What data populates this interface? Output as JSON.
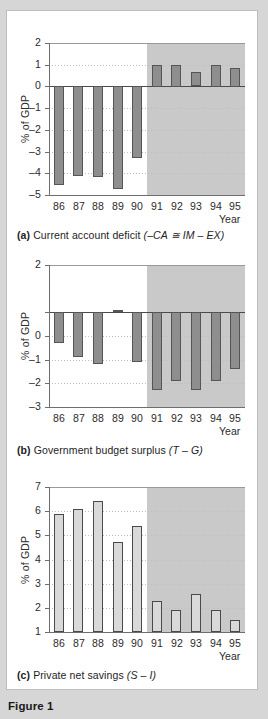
{
  "figure": {
    "label": "Figure 1",
    "panels": [
      {
        "id": "a",
        "tag": "(a)",
        "caption_text": "Current account deficit (–CA ≅ IM – EX)",
        "caption_plain": "Current account deficit",
        "caption_formula": "(–CA ≅ IM – EX)",
        "ylabel": "% of GDP",
        "xlabel": "Year",
        "yticks": [
          "2",
          "1",
          "0",
          "–1",
          "–2",
          "–3",
          "–4",
          "–5"
        ],
        "xticks": [
          "86",
          "87",
          "88",
          "89",
          "90",
          "91",
          "92",
          "93",
          "94",
          "95"
        ]
      },
      {
        "id": "b",
        "tag": "(b)",
        "caption_text": "Government budget surplus (T – G)",
        "caption_plain": "Government budget surplus",
        "caption_formula": "(T – G)",
        "ylabel": "% of GDP",
        "xlabel": "Year",
        "yticks": [
          "2",
          "",
          "0",
          "–1",
          "–2",
          "–3",
          "–4"
        ],
        "xticks": [
          "86",
          "87",
          "88",
          "89",
          "90",
          "91",
          "92",
          "93",
          "94",
          "95"
        ]
      },
      {
        "id": "c",
        "tag": "(c)",
        "caption_text": "Private net savings (S – I)",
        "caption_plain": "Private net savings",
        "caption_formula": "(S – I)",
        "ylabel": "% of GDP",
        "xlabel": "Year",
        "yticks": [
          "7",
          "6",
          "5",
          "4",
          "3",
          "2",
          "1"
        ],
        "xticks": [
          "86",
          "87",
          "88",
          "89",
          "90",
          "91",
          "92",
          "93",
          "94",
          "95"
        ]
      }
    ]
  },
  "colors": {
    "page_background": "#d6d6d6",
    "card_background": "#ffffff",
    "shaded_region": "#c9c9c9",
    "bar_dark_fill": "#8e8e8e",
    "bar_dark_stroke": "#555555",
    "bar_light_fill": "#d9d9d9",
    "bar_light_stroke": "#4a4a4a",
    "axis": "#6e6e6e",
    "gridline": "#bdbdbd",
    "text": "#1d1d1d"
  },
  "chart_data": [
    {
      "type": "bar",
      "panel": "a",
      "title": "Current account deficit (–CA ≅ IM – EX)",
      "xlabel": "Year",
      "ylabel": "% of GDP",
      "categories": [
        "86",
        "87",
        "88",
        "89",
        "90",
        "91",
        "92",
        "93",
        "94",
        "95"
      ],
      "values": [
        -4.55,
        -4.15,
        -4.2,
        -4.75,
        -3.3,
        1.0,
        1.0,
        0.65,
        1.0,
        0.87
      ],
      "ylim": [
        -5,
        2
      ],
      "yticks": [
        2,
        1,
        0,
        -1,
        -2,
        -3,
        -4,
        -5
      ],
      "grid": true,
      "legend": "none",
      "shaded_from": "91",
      "shaded_to": "95",
      "bar_style": "dark-grey-filled"
    },
    {
      "type": "bar",
      "panel": "b",
      "title": "Government budget surplus (T – G)",
      "xlabel": "Year",
      "ylabel": "% of GDP",
      "categories": [
        "86",
        "87",
        "88",
        "89",
        "90",
        "91",
        "92",
        "93",
        "94",
        "95"
      ],
      "values": [
        -1.3,
        -1.9,
        -2.2,
        0.08,
        -2.1,
        -3.3,
        -2.9,
        -3.3,
        -2.9,
        -2.4
      ],
      "ylim": [
        -4,
        2
      ],
      "yticks": [
        2,
        0,
        -1,
        -2,
        -3,
        -4
      ],
      "grid": true,
      "legend": "none",
      "shaded_from": "91",
      "shaded_to": "95",
      "bar_style": "dark-grey-filled"
    },
    {
      "type": "bar",
      "panel": "c",
      "title": "Private net savings (S – I)",
      "xlabel": "Year",
      "ylabel": "% of GDP",
      "categories": [
        "86",
        "87",
        "88",
        "89",
        "90",
        "91",
        "92",
        "93",
        "94",
        "95"
      ],
      "values": [
        5.9,
        6.1,
        6.4,
        4.73,
        5.38,
        2.3,
        1.9,
        2.58,
        1.9,
        1.5
      ],
      "ylim": [
        1,
        7
      ],
      "yticks": [
        7,
        6,
        5,
        4,
        3,
        2,
        1
      ],
      "grid": true,
      "legend": "none",
      "shaded_from": "91",
      "shaded_to": "95",
      "bar_style": "light-grey-outlined"
    }
  ]
}
